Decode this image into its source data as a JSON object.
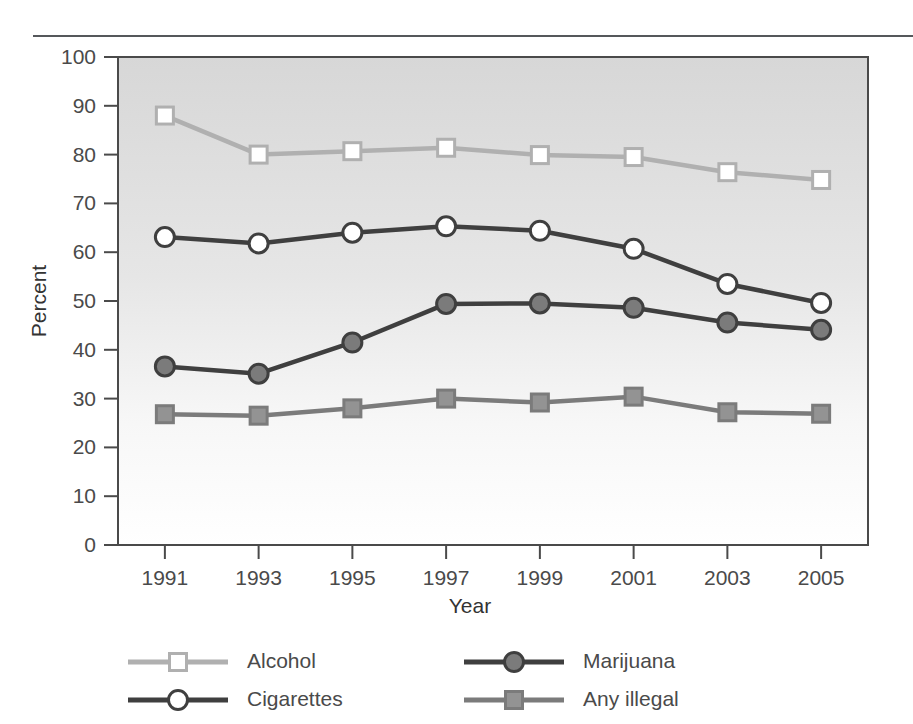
{
  "chart_data": {
    "type": "line",
    "title": "",
    "xlabel": "Year",
    "ylabel": "Percent",
    "categories": [
      "1991",
      "1993",
      "1995",
      "1997",
      "1999",
      "2001",
      "2003",
      "2005"
    ],
    "x": [
      1991,
      1993,
      1995,
      1997,
      1999,
      2001,
      2003,
      2005
    ],
    "xlim": [
      1990,
      2006
    ],
    "ylim": [
      0,
      100
    ],
    "yticks": [
      "0",
      "10",
      "20",
      "30",
      "40",
      "50",
      "60",
      "70",
      "80",
      "90",
      "100"
    ],
    "ytick_values": [
      0,
      10,
      20,
      30,
      40,
      50,
      60,
      70,
      80,
      90,
      100
    ],
    "grid": false,
    "legend_position": "bottom",
    "series": [
      {
        "name": "Alcohol",
        "values": [
          88.0,
          80.0,
          80.7,
          81.4,
          79.9,
          79.5,
          76.4,
          74.8
        ],
        "color": "#b0b0b0",
        "marker": "open-square",
        "marker_fill": "#ffffff"
      },
      {
        "name": "Cigarettes",
        "values": [
          63.1,
          61.8,
          64.0,
          65.3,
          64.4,
          60.7,
          53.5,
          49.6
        ],
        "color": "#3f3f3f",
        "marker": "open-circle",
        "marker_fill": "#ffffff"
      },
      {
        "name": "Marijuana",
        "values": [
          36.6,
          35.1,
          41.5,
          49.4,
          49.5,
          48.6,
          45.6,
          44.1
        ],
        "color": "#3f3f3f",
        "marker": "filled-circle",
        "marker_fill": "#7b7b7b"
      },
      {
        "name": "Any illegal",
        "values": [
          26.8,
          26.5,
          28.0,
          30.0,
          29.2,
          30.4,
          27.2,
          26.9
        ],
        "color": "#7b7b7b",
        "marker": "filled-square",
        "marker_fill": "#939393"
      }
    ]
  },
  "axes": {
    "y_label": "Percent",
    "x_label": "Year",
    "y_ticks": [
      "100",
      "90",
      "80",
      "70",
      "60",
      "50",
      "40",
      "30",
      "20",
      "10",
      "0"
    ],
    "x_ticks": [
      "1991",
      "1993",
      "1995",
      "1997",
      "1999",
      "2001",
      "2003",
      "2005"
    ]
  },
  "legend": {
    "entries": [
      {
        "label": "Alcohol",
        "color": "#b0b0b0",
        "marker": "open-square",
        "fill": "#ffffff"
      },
      {
        "label": "Marijuana",
        "color": "#3f3f3f",
        "marker": "filled-circle",
        "fill": "#7b7b7b"
      },
      {
        "label": "Cigarettes",
        "color": "#3f3f3f",
        "marker": "open-circle",
        "fill": "#ffffff"
      },
      {
        "label": "Any illegal",
        "color": "#7b7b7b",
        "marker": "filled-square",
        "fill": "#939393"
      }
    ]
  },
  "colors": {
    "plot_border": "#4a4a4a",
    "plot_background_top": "#d9d9d9",
    "plot_background_bottom": "#ffffff",
    "rule": "#55585b",
    "text": "#4a4a4a"
  }
}
